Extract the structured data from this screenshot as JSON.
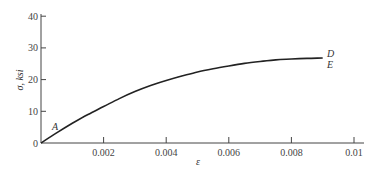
{
  "chart_data": {
    "type": "line",
    "title": "",
    "xlabel": "ε",
    "ylabel": "σ, ksi",
    "xlim": [
      0,
      0.0105
    ],
    "ylim": [
      0,
      40
    ],
    "grid": false,
    "legend": null,
    "x_ticks": [
      0.002,
      0.004,
      0.006,
      0.008,
      0.01
    ],
    "x_tick_labels": [
      "0.002",
      "0.004",
      "0.006",
      "0.008",
      "0.01"
    ],
    "y_ticks": [
      0,
      10,
      20,
      30,
      40
    ],
    "y_tick_labels": [
      "0",
      "10",
      "20",
      "30",
      "40"
    ],
    "series": [
      {
        "name": "stress-strain curve",
        "x": [
          0,
          0.0005,
          0.001,
          0.0015,
          0.002,
          0.0025,
          0.003,
          0.0035,
          0.004,
          0.0045,
          0.005,
          0.0055,
          0.006,
          0.0065,
          0.007,
          0.0075,
          0.008,
          0.0085,
          0.009
        ],
        "values": [
          0,
          3.2,
          6.2,
          9.0,
          11.5,
          14.0,
          16.2,
          18.1,
          19.7,
          21.1,
          22.4,
          23.4,
          24.3,
          25.1,
          25.7,
          26.2,
          26.5,
          26.7,
          26.8
        ]
      }
    ],
    "annotations": [
      {
        "text": "A",
        "x": 0.0004,
        "y": 5
      },
      {
        "text": "D",
        "x": 0.0092,
        "y": 28
      },
      {
        "text": "E",
        "x": 0.0092,
        "y": 25
      }
    ]
  },
  "labels": {
    "xlabel": "ε",
    "ylabel": "σ, ksi",
    "point_A": "A",
    "point_D": "D",
    "point_E": "E",
    "origin": "0"
  }
}
